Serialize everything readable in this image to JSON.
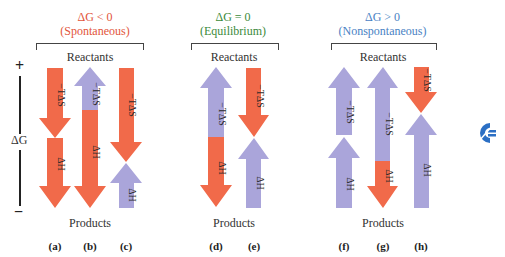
{
  "colors": {
    "negative_red": "#f16a4a",
    "positive_blue": "#aaa5da",
    "spontaneous_title": "#e2553a",
    "equilibrium_title": "#3b8a3b",
    "nonspontaneous_title": "#4a82c4",
    "logo": "#2b6fc4"
  },
  "axis": {
    "label": "ΔG",
    "top_sign": "+",
    "bottom_sign": "−"
  },
  "groups": [
    {
      "condition": "ΔG < 0",
      "description": "(Spontaneous)",
      "top": "Reactants",
      "bottom": "Products"
    },
    {
      "condition": "ΔG = 0",
      "description": "(Equilibrium)",
      "top": "Reactants",
      "bottom": "Products"
    },
    {
      "condition": "ΔG > 0",
      "description": "(Nonspontaneous)",
      "top": "Reactants",
      "bottom": "Products"
    }
  ],
  "columns": [
    {
      "label": "(a)",
      "tds": "−TΔS",
      "dh": "ΔH"
    },
    {
      "label": "(b)",
      "tds": "−TΔS",
      "dh": "ΔH"
    },
    {
      "label": "(c)",
      "tds": "−TΔS",
      "dh": "ΔH"
    },
    {
      "label": "(d)",
      "tds": "−TΔS",
      "dh": "ΔH"
    },
    {
      "label": "(e)",
      "tds": "−TΔS",
      "dh": "ΔH"
    },
    {
      "label": "(f)",
      "tds": "−TΔS",
      "dh": "ΔH"
    },
    {
      "label": "(g)",
      "tds": "−TΔS",
      "dh": "ΔH"
    },
    {
      "label": "(h)",
      "tds": "−TΔS",
      "dh": "ΔH"
    }
  ],
  "logo": {
    "icon": "publisher-logo-icon"
  }
}
